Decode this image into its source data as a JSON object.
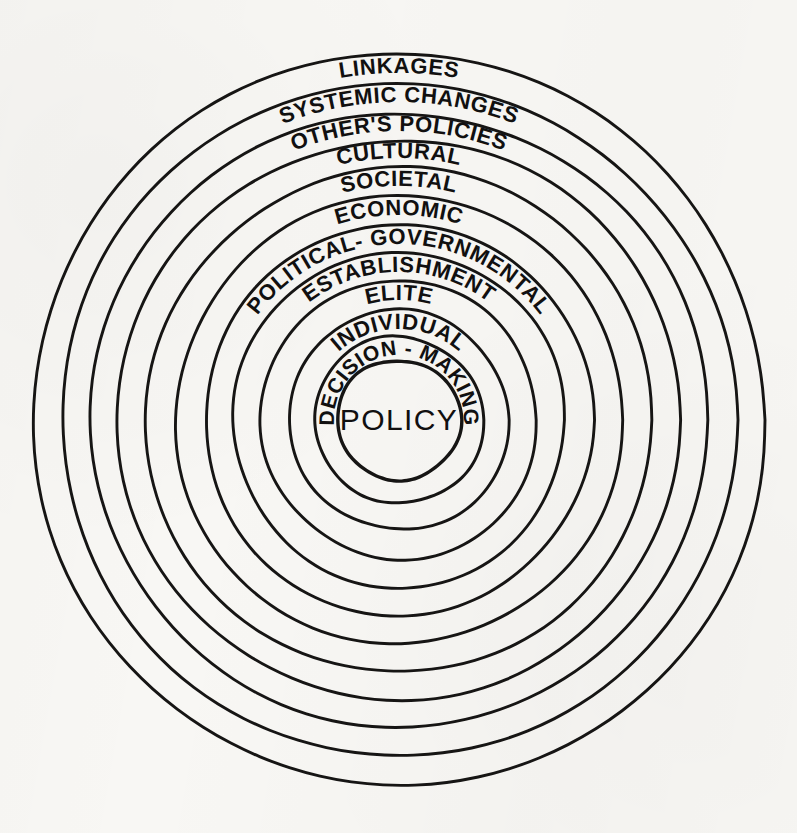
{
  "diagram": {
    "type": "concentric-circles",
    "title": "",
    "background_color": "#f8f7f4",
    "stroke_color": "#161514",
    "center": {
      "x": 399,
      "y": 420
    },
    "center_label": "POLICY",
    "rings": [
      {
        "index": 1,
        "label": "LINKAGES",
        "radius": 366,
        "font_size": 22,
        "curve_sweep": 48
      },
      {
        "index": 2,
        "label": "SYSTEMIC CHANGES",
        "radius": 337,
        "font_size": 22,
        "curve_sweep": 74
      },
      {
        "index": 3,
        "label": "OTHER'S POLICIES",
        "radius": 308,
        "font_size": 22,
        "curve_sweep": 76
      },
      {
        "index": 4,
        "label": "CULTURAL",
        "radius": 281,
        "font_size": 22,
        "curve_sweep": 50
      },
      {
        "index": 5,
        "label": "SOCIETAL",
        "radius": 253,
        "font_size": 22,
        "curve_sweep": 50
      },
      {
        "index": 6,
        "label": "ECONOMIC",
        "radius": 224,
        "font_size": 22,
        "curve_sweep": 60
      },
      {
        "index": 7,
        "label": "POLITICAL- GOVERNMENTAL",
        "radius": 195,
        "font_size": 22,
        "curve_sweep": 150
      },
      {
        "index": 8,
        "label": "ESTABLISHMENT",
        "radius": 167,
        "font_size": 22,
        "curve_sweep": 115
      },
      {
        "index": 9,
        "label": "ELITE",
        "radius": 139,
        "font_size": 22,
        "curve_sweep": 46
      },
      {
        "index": 10,
        "label": "INDIVIDUAL",
        "radius": 110,
        "font_size": 22,
        "curve_sweep": 96
      },
      {
        "index": 11,
        "label": "DECISION - MAKING",
        "radius": 84,
        "font_size": 21,
        "curve_sweep": 178
      },
      {
        "index": 12,
        "label": "",
        "radius": 61,
        "font_size": 0,
        "curve_sweep": 0
      }
    ]
  }
}
